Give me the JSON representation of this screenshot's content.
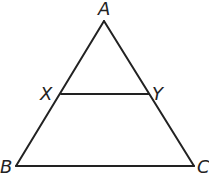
{
  "diagram": {
    "type": "triangle-with-parallel-segment",
    "points": {
      "A": {
        "label": "A",
        "x": 104,
        "y": 21
      },
      "B": {
        "label": "B",
        "x": 16,
        "y": 166
      },
      "C": {
        "label": "C",
        "x": 194,
        "y": 166
      },
      "X": {
        "label": "X",
        "x": 61,
        "y": 94
      },
      "Y": {
        "label": "Y",
        "x": 149,
        "y": 94
      }
    },
    "segments": [
      "AB",
      "AC",
      "BC",
      "XY"
    ],
    "colors": {
      "line": "#222222",
      "background": "#ffffff"
    }
  }
}
